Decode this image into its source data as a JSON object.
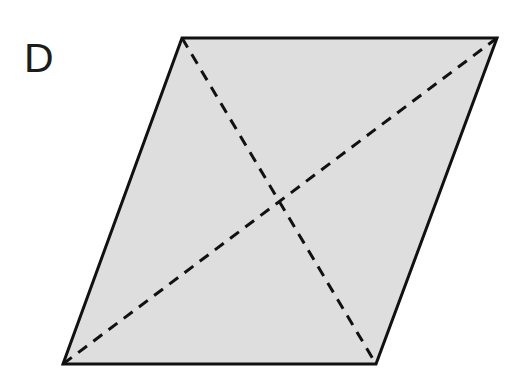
{
  "figure": {
    "label": "D",
    "label_position": {
      "x": 24,
      "y": 72
    },
    "shape_name": "parallelogram",
    "background_color": "#ffffff",
    "fill_color": "#dedede",
    "outline_color": "#111111",
    "outline_width": 3,
    "diagonal_color": "#111111",
    "diagonal_width": 3,
    "diagonal_style": "dashed",
    "diagonal_dash_pattern": "11 8",
    "vertices": {
      "top_left": {
        "x": 182,
        "y": 38
      },
      "top_right": {
        "x": 497,
        "y": 38
      },
      "bottom_right": {
        "x": 376,
        "y": 364
      },
      "bottom_left": {
        "x": 63,
        "y": 364
      }
    },
    "outline_points": "182,38 497,38 376,364 63,364",
    "diagonals": [
      {
        "name": "diagonal-top-left-to-bottom-right",
        "x1": 182,
        "y1": 38,
        "x2": 376,
        "y2": 364
      },
      {
        "name": "diagonal-bottom-left-to-top-right",
        "x1": 63,
        "y1": 364,
        "x2": 497,
        "y2": 38
      }
    ],
    "diagonal_intersection": {
      "x": 280,
      "y": 201
    }
  },
  "chart_data": {
    "type": "diagram",
    "title": "D",
    "shape": "parallelogram",
    "vertices": [
      [
        182,
        38
      ],
      [
        497,
        38
      ],
      [
        376,
        364
      ],
      [
        63,
        364
      ]
    ],
    "diagonal_segments": [
      [
        [
          182,
          38
        ],
        [
          376,
          364
        ]
      ],
      [
        [
          63,
          364
        ],
        [
          497,
          38
        ]
      ]
    ],
    "fill": "#dedede",
    "stroke": "#111111"
  }
}
